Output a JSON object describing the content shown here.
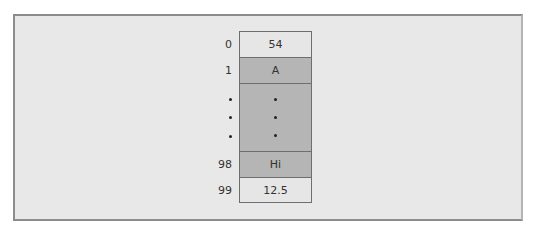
{
  "diagram": {
    "type": "array-memory-layout",
    "cells": [
      {
        "index": "0",
        "value": "54",
        "shade": "light"
      },
      {
        "index": "1",
        "value": "A",
        "shade": "dark"
      },
      {
        "index": "•",
        "value": "•",
        "shade": "dark",
        "ellipsis": true
      },
      {
        "index": "98",
        "value": "Hi",
        "shade": "dark"
      },
      {
        "index": "99",
        "value": "12.5",
        "shade": "light"
      }
    ],
    "ellipsis_dots": 3,
    "colors": {
      "frame_background": "#e8e8e8",
      "frame_border": "#8c8c8c",
      "cell_light": "#e6e6e6",
      "cell_dark": "#b5b5b5",
      "cell_border": "#6e6e6e",
      "text": "#333333"
    }
  }
}
